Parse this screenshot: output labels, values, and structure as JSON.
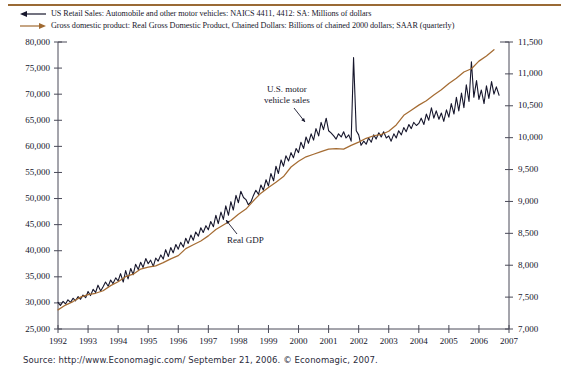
{
  "legend": {
    "items": [
      {
        "icon": "line-arrow-left-black",
        "color": "#16162c",
        "label": "US Retail Sales: Automobile and other motor vehicles: NAICS 4411, 4412: SA: Millions of dollars"
      },
      {
        "icon": "line-arrow-right-brown",
        "color": "#a06a31",
        "label": "Gross domestic product: Real Gross Domestic Product, Chained Dollars: Billions of chained 2000 dollars; SAAR (quarterly)"
      }
    ]
  },
  "annotations": [
    {
      "name": "motor-vehicle-sales-annotation",
      "text_line1": "U.S. motor",
      "text_line2": "vehicle sales"
    },
    {
      "name": "real-gdp-annotation",
      "text_line1": "Real GDP"
    }
  ],
  "source": {
    "text": "Source: http://www.Economagic.com/ September 21, 2006. © Economagic, 2007."
  },
  "colors": {
    "retail_sales_line": "#16162c",
    "gdp_line": "#a56c33",
    "axis": "#4a4a58",
    "rule": "#9a6a35",
    "text": "#15152b"
  },
  "chart_data": {
    "type": "line",
    "title": "",
    "subtitle": "",
    "xlabel": "",
    "ylabel": "Millions of dollars",
    "y2label": "Billions of chained 2000 dollars",
    "grid": false,
    "legend_position": "top",
    "xlim": [
      1992,
      2007
    ],
    "xticks": [
      "1992",
      "1993",
      "1994",
      "1995",
      "1996",
      "1997",
      "1998",
      "1999",
      "2000",
      "2001",
      "2002",
      "2003",
      "2004",
      "2005",
      "2006",
      "2007"
    ],
    "ylim": [
      25000,
      80000
    ],
    "yticks": [
      "25,000",
      "30,000",
      "35,000",
      "40,000",
      "45,000",
      "50,000",
      "55,000",
      "60,000",
      "65,000",
      "70,000",
      "75,000",
      "80,000"
    ],
    "y2lim": [
      7000,
      11500
    ],
    "y2ticks": [
      "7,000",
      "7,500",
      "8,000",
      "8,500",
      "9,000",
      "9,500",
      "10,000",
      "10,500",
      "11,000",
      "11,500"
    ],
    "series": [
      {
        "name": "US Retail Sales: Automobile and other motor vehicles",
        "axis": "left",
        "color": "#16162c",
        "units": "Millions of dollars",
        "x": [
          1992.0,
          1992.08,
          1992.17,
          1992.25,
          1992.33,
          1992.42,
          1992.5,
          1992.58,
          1992.67,
          1992.75,
          1992.83,
          1992.92,
          1993.0,
          1993.08,
          1993.17,
          1993.25,
          1993.33,
          1993.42,
          1993.5,
          1993.58,
          1993.67,
          1993.75,
          1993.83,
          1993.92,
          1994.0,
          1994.08,
          1994.17,
          1994.25,
          1994.33,
          1994.42,
          1994.5,
          1994.58,
          1994.67,
          1994.75,
          1994.83,
          1994.92,
          1995.0,
          1995.08,
          1995.17,
          1995.25,
          1995.33,
          1995.42,
          1995.5,
          1995.58,
          1995.67,
          1995.75,
          1995.83,
          1995.92,
          1996.0,
          1996.08,
          1996.17,
          1996.25,
          1996.33,
          1996.42,
          1996.5,
          1996.58,
          1996.67,
          1996.75,
          1996.83,
          1996.92,
          1997.0,
          1997.08,
          1997.17,
          1997.25,
          1997.33,
          1997.42,
          1997.5,
          1997.58,
          1997.67,
          1997.75,
          1997.83,
          1997.92,
          1998.0,
          1998.08,
          1998.17,
          1998.25,
          1998.33,
          1998.42,
          1998.5,
          1998.58,
          1998.67,
          1998.75,
          1998.83,
          1998.92,
          1999.0,
          1999.08,
          1999.17,
          1999.25,
          1999.33,
          1999.42,
          1999.5,
          1999.58,
          1999.67,
          1999.75,
          1999.83,
          1999.92,
          2000.0,
          2000.08,
          2000.17,
          2000.25,
          2000.33,
          2000.42,
          2000.5,
          2000.58,
          2000.67,
          2000.75,
          2000.83,
          2000.92,
          2001.0,
          2001.08,
          2001.17,
          2001.25,
          2001.33,
          2001.42,
          2001.5,
          2001.58,
          2001.67,
          2001.75,
          2001.83,
          2001.92,
          2002.0,
          2002.08,
          2002.17,
          2002.25,
          2002.33,
          2002.42,
          2002.5,
          2002.58,
          2002.67,
          2002.75,
          2002.83,
          2002.92,
          2003.0,
          2003.08,
          2003.17,
          2003.25,
          2003.33,
          2003.42,
          2003.5,
          2003.58,
          2003.67,
          2003.75,
          2003.83,
          2003.92,
          2004.0,
          2004.08,
          2004.17,
          2004.25,
          2004.33,
          2004.42,
          2004.5,
          2004.58,
          2004.67,
          2004.75,
          2004.83,
          2004.92,
          2005.0,
          2005.08,
          2005.17,
          2005.25,
          2005.33,
          2005.42,
          2005.5,
          2005.58,
          2005.67,
          2005.75,
          2005.83,
          2005.92,
          2006.0,
          2006.08,
          2006.17,
          2006.25,
          2006.33,
          2006.42,
          2006.5,
          2006.58,
          2006.67
        ],
        "values": [
          30100,
          29500,
          30300,
          29800,
          30600,
          30100,
          30900,
          30400,
          31200,
          30700,
          31500,
          31000,
          32200,
          31400,
          32600,
          32000,
          33400,
          32300,
          33100,
          34000,
          33200,
          34400,
          33700,
          34800,
          34200,
          35600,
          34000,
          36200,
          34600,
          36600,
          35400,
          37400,
          36400,
          37800,
          36800,
          38500,
          37500,
          38200,
          37000,
          38600,
          38000,
          39200,
          38400,
          40200,
          38900,
          40600,
          39600,
          41200,
          40300,
          41600,
          40700,
          42400,
          41400,
          43000,
          42000,
          43600,
          42800,
          44400,
          43500,
          44800,
          44000,
          45600,
          44600,
          46800,
          45200,
          47400,
          46000,
          48600,
          46800,
          49400,
          47800,
          50600,
          49200,
          51400,
          50200,
          49800,
          48800,
          49400,
          50600,
          51600,
          50800,
          52600,
          51600,
          53600,
          52400,
          54800,
          53400,
          56200,
          54800,
          57400,
          56200,
          58200,
          57200,
          58800,
          57800,
          59600,
          58800,
          60800,
          59600,
          61800,
          60600,
          62400,
          61200,
          63400,
          62000,
          64600,
          63200,
          65400,
          63000,
          62600,
          62000,
          61400,
          62400,
          61800,
          62800,
          61600,
          62200,
          61000,
          77000,
          63000,
          62200,
          60200,
          61000,
          60400,
          61600,
          60800,
          62200,
          61400,
          62600,
          61800,
          62800,
          61600,
          62000,
          61000,
          62400,
          61600,
          63000,
          62200,
          63600,
          62800,
          64200,
          63400,
          64600,
          64000,
          64400,
          65400,
          64200,
          66200,
          65000,
          67400,
          65400,
          66800,
          65200,
          66400,
          64800,
          67000,
          65600,
          68200,
          66200,
          69400,
          66800,
          70200,
          67400,
          71800,
          68600,
          76200,
          69400,
          72600,
          69000,
          70800,
          68200,
          71600,
          69200,
          72400,
          70000,
          71400,
          69800
        ]
      },
      {
        "name": "Real Gross Domestic Product, Chained Dollars",
        "axis": "right",
        "color": "#a56c33",
        "units": "Billions of chained 2000 dollars",
        "x": [
          1992.0,
          1992.25,
          1992.5,
          1992.75,
          1993.0,
          1993.25,
          1993.5,
          1993.75,
          1994.0,
          1994.25,
          1994.5,
          1994.75,
          1995.0,
          1995.25,
          1995.5,
          1995.75,
          1996.0,
          1996.25,
          1996.5,
          1996.75,
          1997.0,
          1997.25,
          1997.5,
          1997.75,
          1998.0,
          1998.25,
          1998.5,
          1998.75,
          1999.0,
          1999.25,
          1999.5,
          1999.75,
          2000.0,
          2000.25,
          2000.5,
          2000.75,
          2001.0,
          2001.25,
          2001.5,
          2001.75,
          2002.0,
          2002.25,
          2002.5,
          2002.75,
          2003.0,
          2003.25,
          2003.5,
          2003.75,
          2004.0,
          2004.25,
          2004.5,
          2004.75,
          2005.0,
          2005.25,
          2005.5,
          2005.75,
          2006.0,
          2006.25,
          2006.5
        ],
        "values": [
          7300,
          7375,
          7430,
          7500,
          7540,
          7560,
          7600,
          7680,
          7740,
          7820,
          7860,
          7940,
          7970,
          7990,
          8040,
          8100,
          8150,
          8260,
          8320,
          8380,
          8460,
          8560,
          8630,
          8700,
          8800,
          8880,
          9010,
          9130,
          9220,
          9300,
          9390,
          9540,
          9630,
          9700,
          9740,
          9780,
          9820,
          9830,
          9820,
          9880,
          9930,
          9990,
          10030,
          10050,
          10100,
          10200,
          10350,
          10430,
          10510,
          10580,
          10670,
          10750,
          10850,
          10930,
          11030,
          11080,
          11200,
          11280,
          11380
        ]
      }
    ],
    "annotations": [
      {
        "text": "U.S. motor vehicle sales",
        "points_to_series": "US Retail Sales",
        "x": 1999.6,
        "y": 62000
      },
      {
        "text": "Real GDP",
        "points_to_series": "Real GDP",
        "x": 1998.6,
        "y": 9050
      }
    ]
  }
}
